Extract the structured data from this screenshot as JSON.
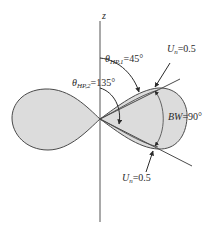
{
  "diagram": {
    "axis_label": "z",
    "theta_hp1": {
      "symbol": "θ",
      "subscript": "HP,1",
      "value": "=45°"
    },
    "theta_hp2": {
      "symbol": "θ",
      "subscript": "HP,2",
      "value": "=135°"
    },
    "un_top": {
      "symbol": "U",
      "subscript": "n",
      "value": "=0.5"
    },
    "un_bottom": {
      "symbol": "U",
      "subscript": "n",
      "value": "=0.5"
    },
    "beamwidth": {
      "symbol": "BW",
      "value": "=90°"
    },
    "colors": {
      "lobe_fill": "#dcdcdc",
      "stroke": "#4a4a4a",
      "text": "#2a2a2a"
    }
  }
}
